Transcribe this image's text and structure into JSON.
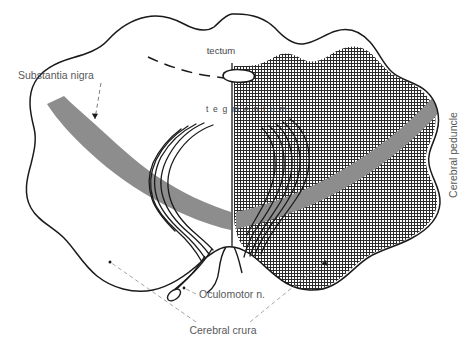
{
  "figure": {
    "title_absent": true,
    "labels": {
      "tectum": "tectum",
      "tegmentum": "t e g m e n t u m",
      "substantia_nigra": "Substantia nigra",
      "cerebral_peduncle": "Cerebral peduncle",
      "oculomotor_nerve": "Oculomotor n.",
      "cerebral_crura": "Cerebral crura"
    },
    "colors": {
      "outline": "#1a1a1a",
      "substantia_nigra_fill": "#8d8d8d",
      "stipple": "#2b2b2b",
      "background": "#ffffff",
      "label_text": "#58585a",
      "leader_line": "#6d6d6d"
    },
    "structures": [
      {
        "name": "tectum",
        "side": "both",
        "shading": "none"
      },
      {
        "name": "tegmentum",
        "side": "both",
        "shading": "stippled-on-right"
      },
      {
        "name": "substantia nigra",
        "side": "both",
        "shading": "solid-gray"
      },
      {
        "name": "cerebral crura",
        "side": "both",
        "shading": "stippled-on-right"
      },
      {
        "name": "cerebral aqueduct",
        "side": "midline",
        "shading": "none"
      },
      {
        "name": "oculomotor nerve fibers",
        "side": "both",
        "shading": "line-bundle"
      }
    ]
  }
}
